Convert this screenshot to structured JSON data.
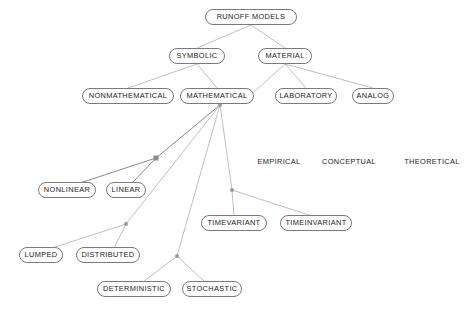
{
  "diagram": {
    "title": "RUNOFF MODELS",
    "background_color": "#ffffff",
    "node_border_color": "#7a7a7a",
    "edge_color": "#b4b4b4",
    "edge_color_dark": "#8a8a8a",
    "junction_color": "#9a9a9a",
    "text_color": "#1a1a1a",
    "nodes": [
      {
        "id": "runoff-models",
        "label": "RUNOFF MODELS",
        "x": 251,
        "y": 17,
        "w": 92,
        "boxed": true
      },
      {
        "id": "symbolic",
        "label": "SYMBOLIC",
        "x": 197,
        "y": 56,
        "w": 56,
        "boxed": true
      },
      {
        "id": "material",
        "label": "MATERIAL",
        "x": 285,
        "y": 56,
        "w": 54,
        "boxed": true
      },
      {
        "id": "nonmathematical",
        "label": "NONMATHEMATICAL",
        "x": 128,
        "y": 96,
        "w": 92,
        "boxed": true
      },
      {
        "id": "mathematical",
        "label": "MATHEMATICAL",
        "x": 217,
        "y": 96,
        "w": 74,
        "boxed": true
      },
      {
        "id": "laboratory",
        "label": "LABORATORY",
        "x": 306,
        "y": 96,
        "w": 62,
        "boxed": true
      },
      {
        "id": "analog",
        "label": "ANALOG",
        "x": 373,
        "y": 96,
        "w": 42,
        "boxed": true
      },
      {
        "id": "nonlinear",
        "label": "NONLINEAR",
        "x": 67,
        "y": 190,
        "w": 58,
        "boxed": true
      },
      {
        "id": "linear",
        "label": "LINEAR",
        "x": 126,
        "y": 190,
        "w": 40,
        "boxed": true
      },
      {
        "id": "lumped",
        "label": "LUMPED",
        "x": 41,
        "y": 255,
        "w": 44,
        "boxed": true
      },
      {
        "id": "distributed",
        "label": "DISTRIBUTED",
        "x": 108,
        "y": 255,
        "w": 64,
        "boxed": true
      },
      {
        "id": "deterministic",
        "label": "DETERMINISTIC",
        "x": 134,
        "y": 289,
        "w": 74,
        "boxed": true
      },
      {
        "id": "stochastic",
        "label": "STOCHASTIC",
        "x": 212,
        "y": 289,
        "w": 60,
        "boxed": true
      },
      {
        "id": "timevariant",
        "label": "TIMEVARIANT",
        "x": 234,
        "y": 223,
        "w": 66,
        "boxed": true
      },
      {
        "id": "timeinvariant",
        "label": "TIMEINVARIANT",
        "x": 316,
        "y": 223,
        "w": 72,
        "boxed": true
      }
    ],
    "plain_labels": [
      {
        "id": "empirical",
        "label": "EMPIRICAL",
        "x": 279,
        "y": 162
      },
      {
        "id": "conceptual",
        "label": "CONCEPTUAL",
        "x": 349,
        "y": 162
      },
      {
        "id": "theoretical",
        "label": "THEORETICAL",
        "x": 432,
        "y": 162
      }
    ],
    "junctions": [
      {
        "id": "junction-linear",
        "x": 156,
        "y": 158,
        "shape": "square"
      },
      {
        "id": "junction-distributed",
        "x": 126,
        "y": 224,
        "shape": "dot"
      },
      {
        "id": "junction-stochastic",
        "x": 177,
        "y": 256,
        "shape": "dot"
      },
      {
        "id": "junction-timevariant",
        "x": 232,
        "y": 190,
        "shape": "dot"
      },
      {
        "id": "hub-mathematical",
        "x": 220,
        "y": 105,
        "shape": "dot"
      }
    ],
    "edges": [
      {
        "from": "runoff-models",
        "to": "symbolic",
        "x1": 251,
        "y1": 25,
        "x2": 197,
        "y2": 48,
        "tone": "light"
      },
      {
        "from": "runoff-models",
        "to": "material",
        "x1": 251,
        "y1": 25,
        "x2": 285,
        "y2": 48,
        "tone": "light"
      },
      {
        "from": "symbolic",
        "to": "nonmathematical",
        "x1": 197,
        "y1": 64,
        "x2": 128,
        "y2": 88,
        "tone": "light"
      },
      {
        "from": "symbolic",
        "to": "mathematical",
        "x1": 197,
        "y1": 64,
        "x2": 217,
        "y2": 88,
        "tone": "light"
      },
      {
        "from": "material",
        "to": "laboratory",
        "x1": 285,
        "y1": 64,
        "x2": 306,
        "y2": 88,
        "tone": "light"
      },
      {
        "from": "material",
        "to": "analog",
        "x1": 285,
        "y1": 64,
        "x2": 373,
        "y2": 88,
        "tone": "light"
      },
      {
        "from": "material",
        "to": "mathematical",
        "x1": 285,
        "y1": 64,
        "x2": 254,
        "y2": 92,
        "tone": "light"
      },
      {
        "from": "mathematical",
        "to": "junction-linear",
        "x1": 220,
        "y1": 105,
        "x2": 156,
        "y2": 158,
        "tone": "dark"
      },
      {
        "from": "junction-linear",
        "to": "nonlinear",
        "x1": 156,
        "y1": 158,
        "x2": 80,
        "y2": 183,
        "tone": "dark"
      },
      {
        "from": "junction-linear",
        "to": "linear",
        "x1": 156,
        "y1": 158,
        "x2": 132,
        "y2": 183,
        "tone": "dark"
      },
      {
        "from": "mathematical",
        "to": "junction-distributed",
        "x1": 220,
        "y1": 105,
        "x2": 126,
        "y2": 224,
        "tone": "light"
      },
      {
        "from": "junction-distributed",
        "to": "lumped",
        "x1": 126,
        "y1": 224,
        "x2": 52,
        "y2": 248,
        "tone": "light"
      },
      {
        "from": "junction-distributed",
        "to": "distributed",
        "x1": 126,
        "y1": 224,
        "x2": 114,
        "y2": 248,
        "tone": "light"
      },
      {
        "from": "mathematical",
        "to": "junction-stochastic",
        "x1": 220,
        "y1": 105,
        "x2": 177,
        "y2": 256,
        "tone": "light"
      },
      {
        "from": "junction-stochastic",
        "to": "deterministic",
        "x1": 177,
        "y1": 256,
        "x2": 143,
        "y2": 282,
        "tone": "light"
      },
      {
        "from": "junction-stochastic",
        "to": "stochastic",
        "x1": 177,
        "y1": 256,
        "x2": 205,
        "y2": 282,
        "tone": "light"
      },
      {
        "from": "mathematical",
        "to": "junction-timevariant",
        "x1": 220,
        "y1": 105,
        "x2": 232,
        "y2": 190,
        "tone": "light"
      },
      {
        "from": "junction-timevariant",
        "to": "timevariant",
        "x1": 232,
        "y1": 190,
        "x2": 234,
        "y2": 216,
        "tone": "light"
      },
      {
        "from": "junction-timevariant",
        "to": "timeinvariant",
        "x1": 232,
        "y1": 190,
        "x2": 312,
        "y2": 216,
        "tone": "light"
      }
    ]
  }
}
